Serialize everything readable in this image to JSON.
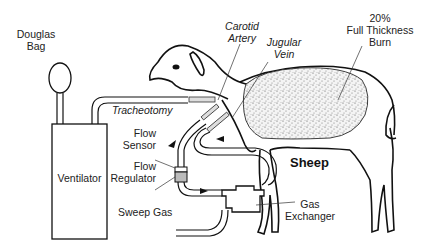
{
  "figure": {
    "subject": "Sheep",
    "labels": {
      "douglas_bag": [
        "Douglas",
        "Bag"
      ],
      "ventilator": "Ventilator",
      "tracheotomy": "Tracheotomy",
      "flow_sensor": [
        "Flow",
        "Sensor"
      ],
      "flow_regulator": [
        "Flow",
        "Regulator"
      ],
      "sweep_gas": "Sweep Gas",
      "carotid_artery": [
        "Carotid",
        "Artery"
      ],
      "jugular_vein": [
        "Jugular",
        "Vein"
      ],
      "burn": [
        "20%",
        "Full Thickness",
        "Burn"
      ],
      "sheep": "Sheep",
      "gas_exchanger": [
        "Gas",
        "Exchanger"
      ]
    },
    "colors": {
      "line": "#111111",
      "burn_fill": "#d8d8d8",
      "regulator_fill": "#bbbbbb",
      "background": "#ffffff"
    }
  }
}
